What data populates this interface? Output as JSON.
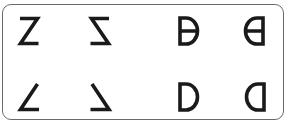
{
  "glyphs": [
    {
      "id": "z-normal",
      "label": "Z",
      "description": "Letter Z, normal orientation"
    },
    {
      "id": "z-mirrored",
      "label": "Z mirrored",
      "description": "Letter Z, horizontally mirrored"
    },
    {
      "id": "d-bar",
      "label": "D with bar",
      "description": "Letter D with horizontal middle bar"
    },
    {
      "id": "d-bar-mirrored",
      "label": "D with bar mirrored",
      "description": "Letter D with middle bar, horizontally mirrored"
    },
    {
      "id": "z-no-top",
      "label": "Z without top stroke",
      "description": "Letter Z missing its top stroke"
    },
    {
      "id": "z-no-top-mirrored",
      "label": "Mirrored Z without top stroke",
      "description": "Mirrored Z missing its top stroke"
    },
    {
      "id": "d-normal",
      "label": "D",
      "description": "Letter D, normal orientation"
    },
    {
      "id": "d-mirrored",
      "label": "D mirrored",
      "description": "Letter D, horizontally mirrored"
    }
  ],
  "colors": {
    "ink": "#1a1a1a",
    "border": "#6a6a6a",
    "background": "#ffffff"
  }
}
